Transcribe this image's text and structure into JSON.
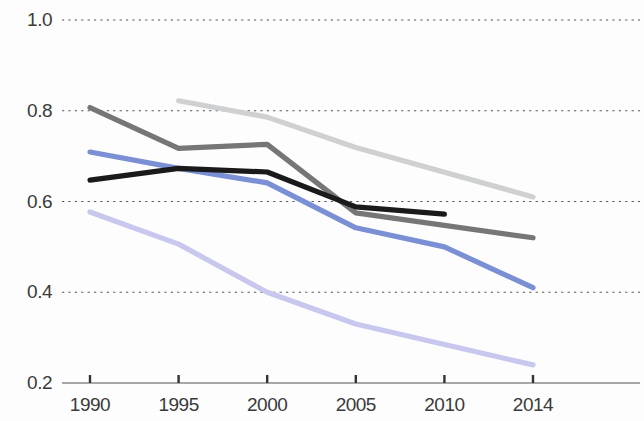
{
  "chart_data": {
    "type": "line",
    "title": "",
    "subtitle": "",
    "xlabel": "",
    "ylabel": "",
    "x": [
      1990,
      1995,
      2000,
      2005,
      2010,
      2014
    ],
    "xtick_labels": [
      "1990",
      "1995",
      "2000",
      "2005",
      "2010",
      "2014"
    ],
    "ytick_labels": [
      "1.0",
      "0.8",
      "0.6",
      "0.4",
      "0.2"
    ],
    "yticks": [
      1.0,
      0.8,
      0.6,
      0.4,
      0.2
    ],
    "ylim": [
      0.2,
      1.0
    ],
    "xlim": [
      1990,
      2014
    ],
    "grid": "horizontal-dotted",
    "legend": "none",
    "series": [
      {
        "name": "silver-line",
        "color": "#cfd0d1",
        "x": [
          1995,
          2000,
          2005,
          2014
        ],
        "values": [
          0.822,
          0.786,
          0.719,
          0.61
        ]
      },
      {
        "name": "dark-gray-line",
        "color": "#767676",
        "x": [
          1990,
          1995,
          2000,
          2005,
          2014
        ],
        "values": [
          0.807,
          0.717,
          0.726,
          0.575,
          0.52
        ]
      },
      {
        "name": "blue-line",
        "color": "#7a8fd4",
        "x": [
          1990,
          1995,
          2000,
          2005,
          2010,
          2014
        ],
        "values": [
          0.709,
          0.673,
          0.641,
          0.542,
          0.5,
          0.41
        ]
      },
      {
        "name": "black-line",
        "color": "#1a1a1a",
        "x": [
          1990,
          1995,
          2000,
          2005,
          2010
        ],
        "values": [
          0.647,
          0.673,
          0.665,
          0.588,
          0.572
        ]
      },
      {
        "name": "light-purple-line",
        "color": "#c8c8ef",
        "x": [
          1990,
          1995,
          2000,
          2005,
          2014
        ],
        "values": [
          0.577,
          0.506,
          0.4,
          0.33,
          0.24
        ]
      }
    ]
  },
  "axis": {
    "y_labels": [
      "1.0",
      "0.8",
      "0.6",
      "0.4",
      "0.2"
    ],
    "x_labels": [
      "1990",
      "1995",
      "2000",
      "2005",
      "2010",
      "2014"
    ],
    "gridline_color": "#555555",
    "baseline_color": "#8a8a8a",
    "tick_color": "#333333"
  }
}
